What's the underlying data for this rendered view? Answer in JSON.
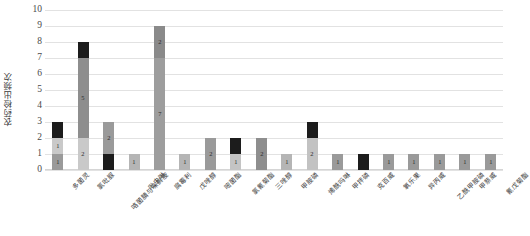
{
  "chart_data": {
    "type": "bar",
    "subtype": "stacked-bar",
    "title": "",
    "xlabel": "",
    "ylabel": "农药检出频次",
    "ylim": [
      0,
      10
    ],
    "yticks": [
      0,
      1,
      2,
      3,
      4,
      5,
      6,
      7,
      8,
      9,
      10
    ],
    "grid": true,
    "legend": "none",
    "categories": [
      "多菌灵",
      "氯吡脲",
      "咯菌腈与咪鲜胺",
      "吡虫啉",
      "腐霉利",
      "戊唑醇",
      "嘧菌酯",
      "氯氰菊酯",
      "三唑醇",
      "甲胺磷",
      "烯酰吗啉",
      "甲拌磷",
      "克百威",
      "氧乐果",
      "异丙威",
      "乙酰甲胺磷",
      "甲萘威",
      "氰戊菊酯"
    ],
    "series": [
      {
        "name": "series-1",
        "color": "#9a9a9a",
        "values": [
          1,
          2,
          1,
          1,
          7,
          1,
          2,
          1,
          2,
          1,
          2,
          1,
          1,
          1,
          1,
          1,
          1,
          1
        ]
      },
      {
        "name": "series-2",
        "color": "#c9c9c9",
        "values": [
          1,
          5,
          2,
          0,
          2,
          0,
          0,
          1,
          0,
          0,
          1,
          0,
          0,
          0,
          0,
          0,
          0,
          0
        ]
      },
      {
        "name": "series-3",
        "color": "#1c1c1c",
        "values": [
          1,
          1,
          0,
          0,
          0,
          0,
          0,
          1,
          0,
          0,
          0,
          0,
          0,
          0,
          0,
          0,
          0,
          0
        ]
      }
    ],
    "totals": [
      3,
      8,
      3,
      1,
      9,
      1,
      2,
      2,
      2,
      1,
      3,
      1,
      1,
      1,
      1,
      1,
      1,
      1
    ],
    "bar_segments": [
      [
        {
          "value": 1,
          "color": "#9a9a9a",
          "label": "1",
          "label_color": "#2b2b2b"
        },
        {
          "value": 1,
          "color": "#c9c9c9",
          "label": "1",
          "label_color": "#2b2b2b"
        },
        {
          "value": 1,
          "color": "#1c1c1c",
          "label": "",
          "label_color": "#ffffff"
        }
      ],
      [
        {
          "value": 2,
          "color": "#c9c9c9",
          "label": "2",
          "label_color": "#2b2b2b"
        },
        {
          "value": 5,
          "color": "#8e8e8e",
          "label": "5",
          "label_color": "#2b2b2b"
        },
        {
          "value": 1,
          "color": "#1c1c1c",
          "label": "",
          "label_color": "#ffffff"
        }
      ],
      [
        {
          "value": 1,
          "color": "#1c1c1c",
          "label": "",
          "label_color": "#ffffff"
        },
        {
          "value": 2,
          "color": "#9a9a9a",
          "label": "2",
          "label_color": "#2b2b2b"
        }
      ],
      [
        {
          "value": 1,
          "color": "#b5b5b5",
          "label": "1",
          "label_color": "#2b2b2b"
        }
      ],
      [
        {
          "value": 7,
          "color": "#9d9d9d",
          "label": "7",
          "label_color": "#2b2b2b"
        },
        {
          "value": 2,
          "color": "#8a8a8a",
          "label": "2",
          "label_color": "#2b2b2b"
        }
      ],
      [
        {
          "value": 1,
          "color": "#b5b5b5",
          "label": "1",
          "label_color": "#2b2b2b"
        }
      ],
      [
        {
          "value": 2,
          "color": "#9a9a9a",
          "label": "2",
          "label_color": "#2b2b2b"
        }
      ],
      [
        {
          "value": 1,
          "color": "#c4c4c4",
          "label": "1",
          "label_color": "#2b2b2b"
        },
        {
          "value": 1,
          "color": "#1c1c1c",
          "label": "",
          "label_color": "#ffffff"
        }
      ],
      [
        {
          "value": 2,
          "color": "#8e8e8e",
          "label": "2",
          "label_color": "#2b2b2b"
        }
      ],
      [
        {
          "value": 1,
          "color": "#b5b5b5",
          "label": "1",
          "label_color": "#2b2b2b"
        }
      ],
      [
        {
          "value": 2,
          "color": "#c2c2c2",
          "label": "2",
          "label_color": "#2b2b2b"
        },
        {
          "value": 1,
          "color": "#1c1c1c",
          "label": "",
          "label_color": "#ffffff"
        }
      ],
      [
        {
          "value": 1,
          "color": "#9a9a9a",
          "label": "1",
          "label_color": "#2b2b2b"
        }
      ],
      [
        {
          "value": 1,
          "color": "#1c1c1c",
          "label": "",
          "label_color": "#ffffff"
        }
      ],
      [
        {
          "value": 1,
          "color": "#9a9a9a",
          "label": "1",
          "label_color": "#2b2b2b"
        }
      ],
      [
        {
          "value": 1,
          "color": "#9a9a9a",
          "label": "1",
          "label_color": "#2b2b2b"
        }
      ],
      [
        {
          "value": 1,
          "color": "#9a9a9a",
          "label": "1",
          "label_color": "#2b2b2b"
        }
      ],
      [
        {
          "value": 1,
          "color": "#9a9a9a",
          "label": "1",
          "label_color": "#2b2b2b"
        }
      ],
      [
        {
          "value": 1,
          "color": "#9a9a9a",
          "label": "1",
          "label_color": "#2b2b2b"
        }
      ]
    ]
  },
  "axis": {
    "y_title": "农药检出频次"
  },
  "colors": {
    "grid": "#e2e2e2",
    "background": "#ffffff",
    "tick_text": "#4a4a4a"
  }
}
